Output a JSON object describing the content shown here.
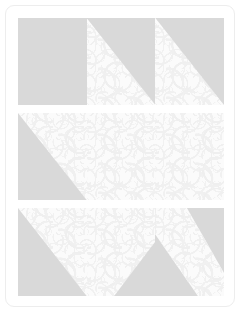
{
  "artwork": {
    "name": "pieced-quilt-block-swatch",
    "title": "Quilt block layout",
    "card_background": "#ffffff",
    "card_border_color": "#ededed",
    "fabrics": [
      {
        "id": "solid",
        "label": "Solid gray fabric",
        "color": "#d9d9d9"
      },
      {
        "id": "print",
        "label": "Printed paisley fabric",
        "color": "#fbfbfb",
        "motif_color": "#f0f0f0"
      }
    ],
    "grid": {
      "rows": 3,
      "columns": 3
    },
    "rows": [
      {
        "name": "row-top",
        "units": [
          {
            "name": "unit-r1c1",
            "type": "whole",
            "base": "solid",
            "overlay": null,
            "overlay_shape": null
          },
          {
            "name": "unit-r1c2",
            "type": "half-square-triangle",
            "base": "print",
            "overlay": "solid",
            "overlay_shape": "tri-tr"
          },
          {
            "name": "unit-r1c3",
            "type": "half-square-triangle",
            "base": "print",
            "overlay": "solid",
            "overlay_shape": "tri-tr"
          }
        ]
      },
      {
        "name": "row-middle",
        "units": [
          {
            "name": "unit-r2c1",
            "type": "half-square-triangle",
            "base": "print",
            "overlay": "solid",
            "overlay_shape": "tri-bl"
          },
          {
            "name": "unit-r2c2",
            "type": "whole",
            "base": "print",
            "overlay": null,
            "overlay_shape": null
          },
          {
            "name": "unit-r2c3",
            "type": "whole",
            "base": "print",
            "overlay": null,
            "overlay_shape": null
          }
        ]
      },
      {
        "name": "row-bottom",
        "units": [
          {
            "name": "unit-r3c1",
            "type": "half-square-triangle",
            "base": "print",
            "overlay": "solid",
            "overlay_shape": "tri-bl"
          },
          {
            "name": "unit-r3c2",
            "type": "corner-wedge",
            "base": "print",
            "overlay": "solid",
            "overlay_shape": "wedge-br"
          },
          {
            "name": "unit-r3c3",
            "type": "diagonal-sash",
            "base": "solid",
            "overlay": "print",
            "overlay_shape": "sash-diag"
          }
        ]
      }
    ]
  }
}
